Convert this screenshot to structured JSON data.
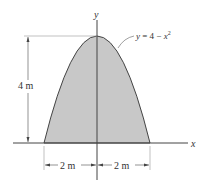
{
  "diagram": {
    "type": "parabolic-area",
    "curve_label": "y = 4 − x",
    "curve_exponent": "2",
    "axis_x_label": "x",
    "axis_y_label": "y",
    "height_dimension": "4 m",
    "left_width_dimension": "2 m",
    "right_width_dimension": "2 m",
    "colors": {
      "fill": "#c8c8c8",
      "stroke": "#444444",
      "dimension": "#666666"
    }
  }
}
